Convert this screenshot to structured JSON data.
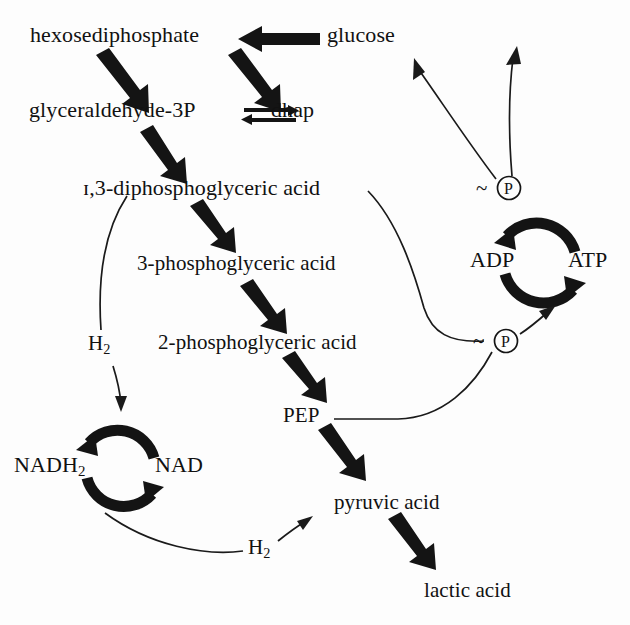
{
  "diagram": {
    "background_color": "#fdfdfd",
    "ink_color": "#111111",
    "nodes": {
      "hexosediphosphate": "hexosediphosphate",
      "glucose": "glucose",
      "glyceraldehyde3p": "glyceraldehyde-3P",
      "dhap": "dhap",
      "diphosphoglyceric": "ɪ,3-diphosphoglyceric acid",
      "phosphoglyceric3": "3-phosphoglyceric acid",
      "phosphoglyceric2": "2-phosphoglyceric acid",
      "pep": "PEP",
      "pyruvic": "pyruvic acid",
      "lactic": "lactic acid",
      "adp": "ADP",
      "atp": "ATP",
      "nadh2_main": "NADH",
      "nadh2_sub": "2",
      "nad": "NAD",
      "h2_upper_main": "H",
      "h2_upper_sub": "2",
      "h2_lower_main": "H",
      "h2_lower_sub": "2",
      "phosphate_upper": "P",
      "phosphate_lower": "P",
      "tilde_upper": "~",
      "tilde_lower": "~"
    },
    "cycles": [
      {
        "name": "adp-atp-cycle",
        "left_label": "ADP",
        "right_label": "ATP",
        "center_x": 540,
        "center_y": 263,
        "radius": 40
      },
      {
        "name": "nad-cycle",
        "left_label": "NADH2",
        "right_label": "NAD",
        "center_x": 120,
        "center_y": 468,
        "radius": 38
      }
    ],
    "thick_arrows": [
      {
        "name": "glucose-to-hexosediphosphate",
        "from": "glucose",
        "to": "hexosediphosphate"
      },
      {
        "name": "hexosediphosphate-to-glyceraldehyde3p",
        "from": "hexosediphosphate",
        "to": "glyceraldehyde-3P"
      },
      {
        "name": "hexosediphosphate-to-dhap",
        "from": "hexosediphosphate",
        "to": "dhap"
      },
      {
        "name": "glyceraldehyde3p-to-diphosphoglyceric",
        "from": "glyceraldehyde-3P",
        "to": "1,3-diphosphoglyceric acid"
      },
      {
        "name": "diphosphoglyceric-to-3phosphoglyceric",
        "from": "1,3-diphosphoglyceric acid",
        "to": "3-phosphoglyceric acid"
      },
      {
        "name": "3phosphoglyceric-to-2phosphoglyceric",
        "from": "3-phosphoglyceric acid",
        "to": "2-phosphoglyceric acid"
      },
      {
        "name": "2phosphoglyceric-to-pep",
        "from": "2-phosphoglyceric acid",
        "to": "PEP"
      },
      {
        "name": "pep-to-pyruvic",
        "from": "PEP",
        "to": "pyruvic acid"
      },
      {
        "name": "pyruvic-to-lactic",
        "from": "pyruvic acid",
        "to": "lactic acid"
      }
    ],
    "equilibrium_arrow": {
      "name": "glyceraldehyde3p-dhap-equilibrium",
      "left": "glyceraldehyde-3P",
      "right": "dhap",
      "reversible": true
    },
    "thin_connectors": [
      {
        "name": "diphosphoglyceric-to-h2",
        "from": "1,3-diphosphoglyceric acid",
        "to": "H2 (upper)"
      },
      {
        "name": "h2-to-nad-cycle",
        "from": "H2 (upper)",
        "to": "NAD cycle"
      },
      {
        "name": "nad-cycle-to-h2-lower",
        "from": "NAD cycle",
        "to": "H2 (lower)"
      },
      {
        "name": "h2-lower-to-pyruvic",
        "from": "H2 (lower)",
        "to": "pyruvic acid"
      },
      {
        "name": "diphosphoglyceric-to-phosphate-lower",
        "from": "1,3-diphosphoglyceric acid",
        "to": "~P (lower)"
      },
      {
        "name": "pep-to-phosphate-lower",
        "from": "PEP",
        "to": "~P (lower)"
      },
      {
        "name": "phosphate-lower-to-atp",
        "from": "~P (lower)",
        "to": "ATP"
      },
      {
        "name": "phosphate-upper-to-glucose",
        "from": "~P (upper)",
        "to": "glucose"
      },
      {
        "name": "phosphate-upper-to-top",
        "from": "~P (upper)",
        "to": "top (offscreen)"
      }
    ]
  }
}
